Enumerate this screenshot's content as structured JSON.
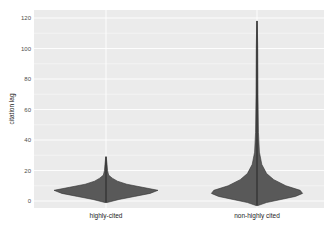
{
  "chart_data": {
    "type": "violin",
    "title": "",
    "xlabel": "",
    "ylabel": "citation lag",
    "categories": [
      "highly-cited",
      "non-highly cited"
    ],
    "ylim": [
      -5,
      125
    ],
    "yticks": [
      0,
      20,
      40,
      60,
      80,
      100,
      120
    ],
    "grid": true,
    "legend": null,
    "series": [
      {
        "name": "highly-cited",
        "min": -1,
        "max": 29,
        "mode": 7,
        "profile": [
          {
            "y": -1,
            "w": 0.02
          },
          {
            "y": 1,
            "w": 0.25
          },
          {
            "y": 3,
            "w": 0.55
          },
          {
            "y": 5,
            "w": 0.85
          },
          {
            "y": 7,
            "w": 1.0
          },
          {
            "y": 9,
            "w": 0.7
          },
          {
            "y": 11,
            "w": 0.4
          },
          {
            "y": 13,
            "w": 0.22
          },
          {
            "y": 15,
            "w": 0.12
          },
          {
            "y": 17,
            "w": 0.05
          },
          {
            "y": 20,
            "w": 0.03
          },
          {
            "y": 24,
            "w": 0.02
          },
          {
            "y": 29,
            "w": 0.005
          }
        ]
      },
      {
        "name": "non-highly cited",
        "min": -3,
        "max": 118,
        "mode": 5,
        "profile": [
          {
            "y": -3,
            "w": 0.02
          },
          {
            "y": -1,
            "w": 0.2
          },
          {
            "y": 1,
            "w": 0.5
          },
          {
            "y": 3,
            "w": 0.8
          },
          {
            "y": 5,
            "w": 0.95
          },
          {
            "y": 7,
            "w": 0.9
          },
          {
            "y": 10,
            "w": 0.6
          },
          {
            "y": 14,
            "w": 0.35
          },
          {
            "y": 18,
            "w": 0.2
          },
          {
            "y": 24,
            "w": 0.1
          },
          {
            "y": 32,
            "w": 0.05
          },
          {
            "y": 45,
            "w": 0.03
          },
          {
            "y": 70,
            "w": 0.02
          },
          {
            "y": 100,
            "w": 0.015
          },
          {
            "y": 118,
            "w": 0.005
          }
        ]
      }
    ],
    "colors": {
      "panel_bg": "#ebebeb",
      "grid": "#ffffff",
      "violin_fill": "#595959",
      "violin_line": "#333333"
    }
  }
}
